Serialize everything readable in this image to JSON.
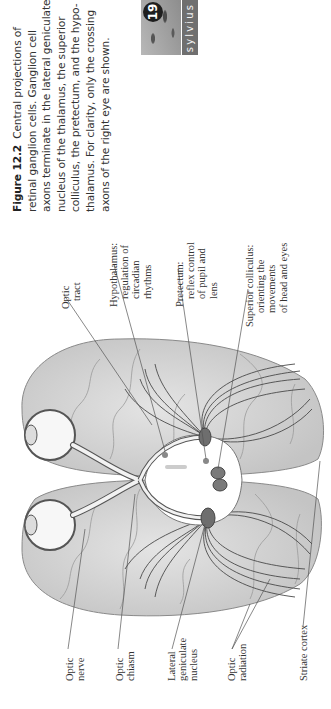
{
  "figure": {
    "number": "Figure 12.2",
    "caption_lines": [
      "Central projections of",
      "retinal ganglion cells. Ganglion cell",
      "axons terminate in the lateral geniculate",
      "nucleus of the thalamus, the superior",
      "colliculus, the pretectum, and the hypo-",
      "thalamus. For clarity, only the crossing",
      "axons of the right eye are shown."
    ],
    "badge": {
      "number": "19",
      "label": "sylvius"
    }
  },
  "labels": {
    "optic_tract": [
      "Optic",
      "tract"
    ],
    "hypothalamus": [
      "Hypothalamus:",
      "regulation of",
      "circadian",
      "rhythms"
    ],
    "pretectum": [
      "Pretectum:",
      "reflex control",
      "of pupil and",
      "lens"
    ],
    "superior_colliculus": [
      "Superior colliculus:",
      "orienting the",
      "movements",
      "of head and eyes"
    ],
    "optic_nerve": [
      "Optic",
      "nerve"
    ],
    "optic_chiasm": [
      "Optic",
      "chiasm"
    ],
    "lateral_geniculate": [
      "Lateral",
      "geniculate",
      "nucleus"
    ],
    "optic_radiation": [
      "Optic",
      "radiation"
    ],
    "striate_cortex": [
      "Striate cortex"
    ]
  },
  "colors": {
    "brain_fill": "#d9d9d9",
    "brain_outline": "#8a8a8a",
    "nucleus_fill": "#6e6e6e",
    "fiber": "#4a4a4a"
  }
}
